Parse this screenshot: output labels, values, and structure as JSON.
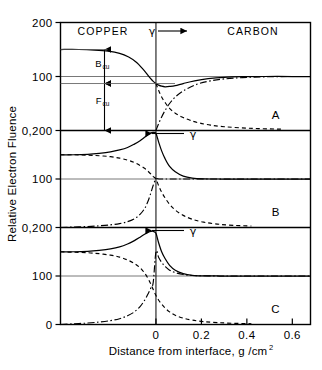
{
  "figure": {
    "ylabel": "Relative Electron Fluence",
    "xlabel_main": "Distance from interface, g /cm",
    "xlabel_sup": "2",
    "region_left": "COPPER",
    "region_right": "CARBON",
    "gamma_symbol": "γ",
    "annotations": {
      "backscatter_label": "B",
      "backscatter_sub": "cu",
      "fluence_label": "F",
      "fluence_sub": "cu"
    }
  },
  "chart_data": {
    "type": "line",
    "xlabel": "Distance from interface, g/cm^2",
    "ylabel": "Relative Electron Fluence",
    "xlim": [
      -0.42,
      0.68
    ],
    "x_ticks": [
      0,
      0.2,
      0.4,
      0.6
    ],
    "x_tick_labels": [
      "0",
      "0.2",
      "0.4",
      "0.6"
    ],
    "ylim_per_panel": [
      0,
      200
    ],
    "grid": false,
    "legend_position": "none",
    "interface_x": 0,
    "panels": [
      {
        "id": "A",
        "label": "A",
        "y_ticks": [
          200,
          100,
          0
        ],
        "y_tick_labels": [
          "200",
          "100",
          "0,200"
        ],
        "gamma_arrow_direction": "right",
        "gamma_label": "γ",
        "reference_level": 100,
        "plateau_left": 150,
        "plateau_right": 100,
        "series": [
          {
            "name": "total fluence",
            "style": "solid",
            "x": [
              -0.42,
              -0.34,
              -0.27,
              -0.21,
              -0.16,
              -0.12,
              -0.085,
              -0.06,
              -0.04,
              -0.025,
              -0.012,
              0.0,
              0.012,
              0.025,
              0.04,
              0.06,
              0.085,
              0.12,
              0.17,
              0.23,
              0.3,
              0.38,
              0.48,
              0.6,
              0.68
            ],
            "y": [
              150,
              150,
              149,
              147,
              143,
              136,
              126,
              115,
              105,
              97,
              91,
              87,
              84,
              82,
              81,
              81.5,
              83,
              87,
              92,
              96,
              98.5,
              99.6,
              100,
              100,
              100
            ]
          },
          {
            "name": "copper backscatter component",
            "style": "dashed",
            "x": [
              0.0,
              0.012,
              0.025,
              0.04,
              0.06,
              0.085,
              0.115,
              0.15,
              0.19,
              0.24,
              0.3,
              0.37,
              0.45,
              0.55
            ],
            "y": [
              87,
              74,
              62,
              52,
              41,
              32,
              25,
              19,
              14,
              10,
              7,
              5,
              3.5,
              2.5
            ]
          },
          {
            "name": "carbon buildup component",
            "style": "dashdot",
            "x": [
              0.0,
              0.012,
              0.025,
              0.04,
              0.06,
              0.085,
              0.115,
              0.15,
              0.19,
              0.24,
              0.3,
              0.38,
              0.48,
              0.6,
              0.68
            ],
            "y": [
              0,
              13,
              25,
              37,
              50,
              62,
              72,
              80,
              87,
              92,
              95.5,
              98,
              99.4,
              100,
              100
            ]
          }
        ]
      },
      {
        "id": "B",
        "label": "B",
        "y_ticks": [
          200,
          100,
          0
        ],
        "y_tick_labels": [
          "0,200",
          "100",
          "0,200"
        ],
        "gamma_arrow_direction": "left",
        "gamma_label": "γ",
        "reference_level": 100,
        "plateau_left": 150,
        "plateau_right": 100,
        "series": [
          {
            "name": "total fluence",
            "style": "solid",
            "x": [
              -0.42,
              -0.36,
              -0.3,
              -0.25,
              -0.2,
              -0.16,
              -0.125,
              -0.095,
              -0.07,
              -0.05,
              -0.035,
              -0.022,
              -0.012,
              0.0,
              0.012,
              0.025,
              0.04,
              0.06,
              0.085,
              0.12,
              0.16,
              0.21,
              0.28,
              0.36,
              0.46,
              0.6,
              0.68
            ],
            "y": [
              150,
              150,
              151,
              153,
              156,
              160,
              165,
              172,
              179,
              186,
              191,
              195,
              196,
              194,
              176,
              158,
              142,
              126,
              115,
              106,
              102,
              100.5,
              100,
              100,
              100,
              100,
              100
            ]
          },
          {
            "name": "copper backscatter component",
            "style": "dashed",
            "x": [
              -0.42,
              -0.36,
              -0.3,
              -0.25,
              -0.2,
              -0.16,
              -0.125,
              -0.095,
              -0.07,
              -0.05,
              -0.035,
              -0.022,
              -0.012,
              0.0,
              0.012,
              0.025,
              0.04,
              0.06,
              0.085,
              0.12,
              0.16,
              0.21,
              0.27,
              0.34,
              0.42
            ],
            "y": [
              150,
              150,
              149,
              148,
              146,
              143,
              139,
              134,
              128,
              122,
              116,
              110,
              105,
              100,
              86,
              73,
              61,
              48,
              36,
              25,
              17,
              11,
              7,
              4.5,
              3
            ]
          },
          {
            "name": "carbon buildup component",
            "style": "dashdot",
            "x": [
              -0.42,
              -0.36,
              -0.3,
              -0.25,
              -0.2,
              -0.16,
              -0.125,
              -0.095,
              -0.07,
              -0.05,
              -0.035,
              -0.022,
              -0.012,
              0.0,
              0.015,
              0.035,
              0.06,
              0.1,
              0.15,
              0.22,
              0.3,
              0.4,
              0.52,
              0.68
            ],
            "y": [
              0,
              1,
              2,
              3.5,
              5.5,
              8,
              12,
              18,
              27,
              39,
              54,
              72,
              87,
              100,
              100,
              100,
              100,
              100,
              100,
              100,
              100,
              100,
              100,
              100
            ]
          }
        ]
      },
      {
        "id": "C",
        "label": "C",
        "y_ticks": [
          200,
          100,
          0
        ],
        "y_tick_labels": [
          "0,200",
          "100",
          "0"
        ],
        "gamma_arrow_direction": "left",
        "gamma_label": "γ",
        "reference_level": 100,
        "plateau_left": 150,
        "plateau_right": 100,
        "series": [
          {
            "name": "total fluence",
            "style": "solid",
            "x": [
              -0.42,
              -0.36,
              -0.3,
              -0.25,
              -0.2,
              -0.16,
              -0.125,
              -0.095,
              -0.07,
              -0.05,
              -0.035,
              -0.022,
              -0.012,
              0.0,
              0.012,
              0.025,
              0.04,
              0.06,
              0.085,
              0.12,
              0.16,
              0.21,
              0.28,
              0.36,
              0.46,
              0.6,
              0.68
            ],
            "y": [
              150,
              150,
              151,
              153,
              156,
              160,
              166,
              173,
              180,
              186,
              190,
              192,
              192,
              188,
              168,
              150,
              136,
              122,
              112,
              105,
              101.5,
              100.3,
              100,
              100,
              100,
              100,
              100
            ]
          },
          {
            "name": "copper backscatter component",
            "style": "dashed",
            "x": [
              -0.42,
              -0.36,
              -0.3,
              -0.25,
              -0.2,
              -0.16,
              -0.125,
              -0.095,
              -0.07,
              -0.05,
              -0.035,
              -0.022,
              -0.012,
              0.0,
              0.012,
              0.025,
              0.04,
              0.06,
              0.085,
              0.12,
              0.16,
              0.21,
              0.27,
              0.34,
              0.42
            ],
            "y": [
              150,
              149,
              148,
              146,
              143,
              139,
              133,
              126,
              117,
              106,
              95,
              83,
              72,
              60,
              50,
              42,
              34,
              26,
              19,
              13,
              9,
              6,
              4,
              2.5,
              1.5
            ]
          },
          {
            "name": "carbon buildup component",
            "style": "dashdot",
            "x": [
              -0.42,
              -0.36,
              -0.3,
              -0.25,
              -0.2,
              -0.16,
              -0.125,
              -0.095,
              -0.07,
              -0.05,
              -0.035,
              -0.022,
              -0.012,
              0.0,
              0.012,
              0.025,
              0.04,
              0.06,
              0.085,
              0.12,
              0.17,
              0.23,
              0.3,
              0.4,
              0.52,
              0.68
            ],
            "y": [
              0,
              1.5,
              3,
              5,
              8,
              12,
              18,
              26,
              37,
              50,
              63,
              76,
              87,
              150,
              138,
              128,
              120,
              112,
              107,
              103,
              101,
              100.3,
              100,
              100,
              100,
              100
            ]
          }
        ]
      }
    ]
  }
}
